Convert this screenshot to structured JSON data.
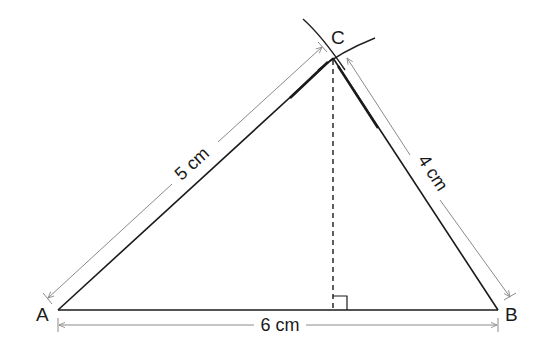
{
  "diagram": {
    "vertices": {
      "A": {
        "label": "A"
      },
      "B": {
        "label": "B"
      },
      "C": {
        "label": "C"
      }
    },
    "measurements": {
      "AC": "5 cm",
      "BC": "4 cm",
      "AB": "6 cm"
    },
    "annotations": {
      "right_angle_marker": "perpendicular from C to AB",
      "arcs": "two compass arcs intersecting at C"
    },
    "colors": {
      "main_line": "#1a1a1a",
      "dimension_line": "#8a8a8a"
    }
  }
}
